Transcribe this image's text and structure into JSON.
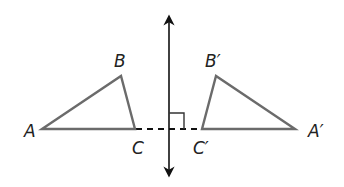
{
  "diagram": {
    "type": "reflection",
    "labels": {
      "A": "A",
      "B": "B",
      "C": "C",
      "A_prime": "A′",
      "B_prime": "B′",
      "C_prime": "C′"
    },
    "colors": {
      "triangle_stroke": "#6b6b6b",
      "line_stroke": "#111111",
      "dashed_stroke": "#111111"
    },
    "right_angle_marker": true
  }
}
